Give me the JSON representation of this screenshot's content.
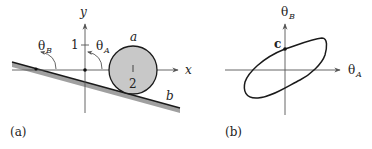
{
  "panel_a": {
    "caption": "(a)",
    "y_axis_label": "y",
    "x_axis_label": "x",
    "tick_1_label": "1",
    "circle_label": "a",
    "circle_center_label": "2",
    "incline_label": "b",
    "theta_b_symbol": "θ",
    "theta_b_sub": "B",
    "theta_a_symbol": "θ",
    "theta_a_sub": "A"
  },
  "panel_b": {
    "caption": "(b)",
    "vertical_axis_symbol": "θ",
    "vertical_axis_sub": "B",
    "horizontal_axis_symbol": "θ",
    "horizontal_axis_sub": "A",
    "point_label": "c"
  },
  "colors": {
    "line": "#1a1a1a",
    "circle_fill": "#c8c8c8",
    "incline_shadow": "#a0a0a0",
    "axis": "#555555"
  }
}
